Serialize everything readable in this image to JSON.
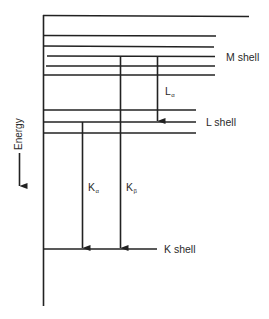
{
  "diagram": {
    "type": "energy-level diagram",
    "axis_label": "Energy",
    "shells": [
      {
        "name": "M shell",
        "label": "M shell"
      },
      {
        "name": "L shell",
        "label": "L shell"
      },
      {
        "name": "K shell",
        "label": "K shell"
      }
    ],
    "transitions": [
      {
        "main": "L",
        "sub": "α",
        "from": "M shell",
        "to": "L shell"
      },
      {
        "main": "K",
        "sub": "α",
        "from": "L shell",
        "to": "K shell"
      },
      {
        "main": "K",
        "sub": "β",
        "from": "M shell",
        "to": "K shell"
      }
    ]
  }
}
